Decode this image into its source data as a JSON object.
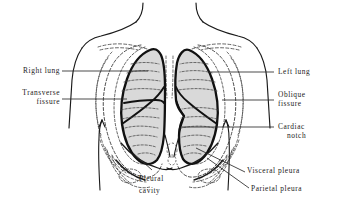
{
  "figure": {
    "type": "anatomical-line-diagram",
    "background_color": "#ffffff",
    "ink_color": "#1a1a1a",
    "lung_fill_color": "#d9d9d9",
    "dashed_color": "#4a4a4a"
  },
  "labels": {
    "right_lung": "Right lung",
    "transverse_fissure_line1": "Transverse",
    "transverse_fissure_line2": "fissure",
    "left_lung": "Left lung",
    "oblique_fissure_line1": "Oblique",
    "oblique_fissure_line2": "fissure",
    "cardiac_notch_line1": "Cardiac",
    "cardiac_notch_line2": "notch",
    "pleural_cavity_line1": "Pleural",
    "pleural_cavity_line2": "cavity",
    "visceral_pleura": "Visceral pleura",
    "parietal_pleura": "Parietal pleura"
  },
  "structures": [
    {
      "name": "right-lung",
      "side": "left-of-image",
      "lobes": 3
    },
    {
      "name": "left-lung",
      "side": "right-of-image",
      "lobes": 2
    },
    {
      "name": "transverse-fissure",
      "belongs_to": "right-lung"
    },
    {
      "name": "oblique-fissure",
      "belongs_to": "both-lungs"
    },
    {
      "name": "cardiac-notch",
      "belongs_to": "left-lung"
    },
    {
      "name": "pleural-cavity",
      "region": "costodiaphragmatic-recess"
    },
    {
      "name": "visceral-pleura",
      "layer": "inner"
    },
    {
      "name": "parietal-pleura",
      "layer": "outer"
    },
    {
      "name": "rib-cage",
      "style": "dashed"
    },
    {
      "name": "clavicle",
      "style": "dashed",
      "count": 2
    },
    {
      "name": "torso-outline",
      "style": "solid"
    },
    {
      "name": "diaphragm",
      "style": "solid"
    }
  ]
}
